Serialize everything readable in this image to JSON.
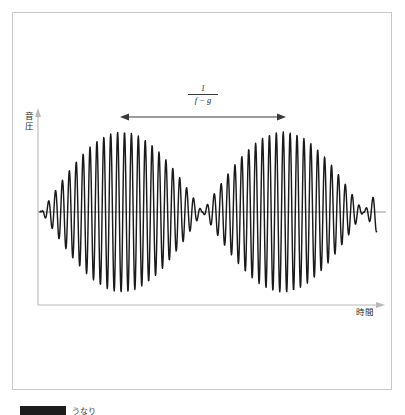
{
  "figure": {
    "axis_y_label": "音\n圧",
    "axis_x_label": "時間",
    "beat_period_numerator": "1",
    "beat_period_denominator": "f − g",
    "caption_text": "うなり",
    "colors": {
      "wave": "#1a1a1a",
      "axis": "#b9b9b9",
      "zero_line": "#5a5a5a",
      "annotation": "#3a3a3a",
      "frame": "#c9c9c9",
      "background": "#ffffff"
    }
  },
  "chart_data": {
    "type": "line",
    "title": "",
    "subtitle": "",
    "xlabel": "時間",
    "ylabel": "音圧",
    "grid": false,
    "legend": null,
    "annotations": [
      {
        "name": "beat-period-arrow",
        "label": "1 / (f − g)",
        "numerator": "1",
        "denominator": "f − g",
        "x_start_px": 122,
        "x_end_px": 284,
        "y_px": 117,
        "meaning": "うなりの周期 = 1/(f−g)"
      }
    ],
    "axes": {
      "x_axis_px": {
        "x_start": 38,
        "x_end": 383,
        "y": 305,
        "arrow": "right"
      },
      "y_axis_px": {
        "x": 38,
        "y_start": 112,
        "y_end": 305,
        "arrow": "up"
      },
      "zero_line_px": {
        "x_start": 38,
        "x_end": 386,
        "y": 212
      }
    },
    "waveform": {
      "description": "2つの近い周波数の正弦波の重ね合わせによるうなり波形",
      "formula": "y = A · cos(pi*(f-g)*t) · sin(2*pi*((f+g)/2)*t)",
      "carrier_period_px": 6.9,
      "beat_period_px": 161,
      "envelope_nodes_px": [
        122,
        283
      ],
      "envelope_antinodes_px": [
        41,
        203,
        364
      ],
      "amplitude_px": 80,
      "center_y_px": 212,
      "x_start_px": 40,
      "x_end_px": 377
    },
    "xlim": [
      0,
      1
    ],
    "ylim": [
      -1,
      1
    ]
  }
}
